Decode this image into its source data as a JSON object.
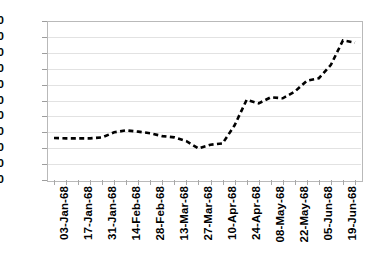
{
  "chart_data": {
    "type": "line",
    "title": "",
    "subtitle": "",
    "xlabel": "",
    "ylabel": "",
    "ylim": [
      200,
      700
    ],
    "y_ticks": [
      200,
      250,
      300,
      350,
      400,
      450,
      500,
      550,
      600,
      650,
      700
    ],
    "grid": true,
    "legend": "none",
    "line_style": "dashed",
    "line_color": "#000000",
    "x_tick_labels": [
      "03-Jan-68",
      "17-Jan-68",
      "31-Jan-68",
      "14-Feb-68",
      "28-Feb-68",
      "13-Mar-68",
      "27-Mar-68",
      "10-Apr-68",
      "24-Apr-68",
      "08-May-68",
      "22-May-68",
      "05-Jun-68",
      "19-Jun-68"
    ],
    "x": [
      "03-Jan-68",
      "10-Jan-68",
      "17-Jan-68",
      "24-Jan-68",
      "31-Jan-68",
      "07-Feb-68",
      "14-Feb-68",
      "21-Feb-68",
      "28-Feb-68",
      "06-Mar-68",
      "13-Mar-68",
      "20-Mar-68",
      "27-Mar-68",
      "03-Apr-68",
      "10-Apr-68",
      "17-Apr-68",
      "24-Apr-68",
      "01-May-68",
      "08-May-68",
      "15-May-68",
      "22-May-68",
      "29-May-68",
      "05-Jun-68",
      "12-Jun-68",
      "19-Jun-68",
      "26-Jun-68"
    ],
    "values": [
      332,
      331,
      331,
      331,
      334,
      350,
      356,
      352,
      347,
      338,
      334,
      322,
      299,
      311,
      315,
      372,
      452,
      441,
      460,
      457,
      478,
      512,
      520,
      562,
      639,
      632
    ],
    "series": [
      {
        "name": "series-1",
        "values": [
          332,
          331,
          331,
          331,
          334,
          350,
          356,
          352,
          347,
          338,
          334,
          322,
          299,
          311,
          315,
          372,
          452,
          441,
          460,
          457,
          478,
          512,
          520,
          562,
          639,
          632
        ]
      }
    ]
  },
  "axes": {
    "y_min": 200,
    "y_max": 700,
    "y_step": 50
  }
}
